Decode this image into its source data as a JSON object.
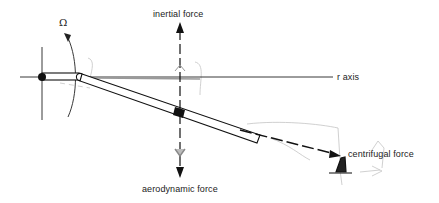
{
  "diagram": {
    "labels": {
      "omega": "Ω",
      "inertial_force": "inertial force",
      "r_axis": "r axis",
      "aerodynamic_force": "aerodynamic force",
      "centrifugal_force": "centrifugal force"
    },
    "colors": {
      "ink": "#111111",
      "faint": "#bbbbbb",
      "text": "#222222",
      "background": "#ffffff"
    }
  }
}
